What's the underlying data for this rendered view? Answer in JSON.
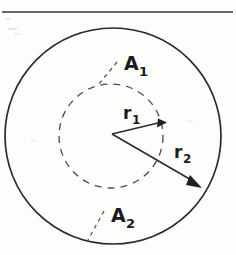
{
  "figure": {
    "canvas": {
      "width": 236,
      "height": 255,
      "background": "#fdfdfc"
    },
    "ink_color": "#2a2a2a",
    "dash_color": "#4a4a4a",
    "rule": {
      "y": 12,
      "x1": 2,
      "x2": 233
    },
    "outer_circle": {
      "cx": 113,
      "cy": 136,
      "r": 108,
      "style": "solid",
      "stroke_width": 1.7
    },
    "inner_circle": {
      "cx": 111,
      "cy": 136,
      "r": 52,
      "style": "dashed",
      "stroke_width": 1.3,
      "dash": "7 6"
    },
    "center_point": {
      "x": 112,
      "y": 134
    },
    "radius_arrows": [
      {
        "name": "r1",
        "label": "r",
        "subscript": "1",
        "from": {
          "x": 112,
          "y": 134
        },
        "to": {
          "x": 163,
          "y": 122
        },
        "label_pos": {
          "x": 125,
          "y": 118
        }
      },
      {
        "name": "r2",
        "label": "r",
        "subscript": "2",
        "from": {
          "x": 112,
          "y": 134
        },
        "to": {
          "x": 199,
          "y": 185
        },
        "label_pos": {
          "x": 175,
          "y": 157
        }
      }
    ],
    "area_labels": [
      {
        "name": "A1",
        "label": "A",
        "subscript": "1",
        "label_pos": {
          "x": 124,
          "y": 70
        },
        "leader": {
          "x1": 117,
          "y1": 62,
          "x2": 99,
          "y2": 84
        },
        "leader_style": "dashed",
        "points_to": "inner-circle"
      },
      {
        "name": "A2",
        "label": "A",
        "subscript": "2",
        "label_pos": {
          "x": 111,
          "y": 222
        },
        "leader": {
          "x1": 104,
          "y1": 211,
          "x2": 88,
          "y2": 240
        },
        "leader_style": "dashed",
        "points_to": "outer-circle"
      }
    ]
  }
}
